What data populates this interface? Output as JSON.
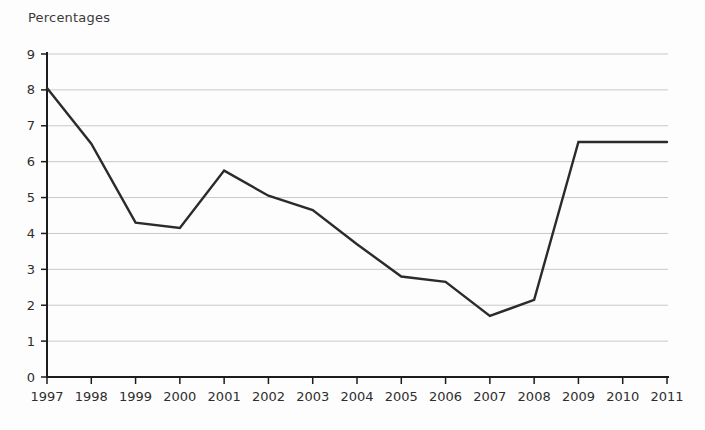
{
  "chart_data": {
    "type": "line",
    "title": "Percentages",
    "xlabel": "",
    "ylabel": "Percentages",
    "x": [
      1997,
      1998,
      1999,
      2000,
      2001,
      2002,
      2003,
      2004,
      2005,
      2006,
      2007,
      2008,
      2009,
      2010,
      2011
    ],
    "values": [
      8.05,
      6.5,
      4.3,
      4.15,
      5.75,
      5.05,
      4.65,
      3.7,
      2.8,
      2.65,
      1.7,
      2.15,
      6.55,
      6.55,
      6.55
    ],
    "ylim": [
      0,
      9
    ],
    "yticks": [
      0,
      1,
      2,
      3,
      4,
      5,
      6,
      7,
      8,
      9
    ],
    "grid": true,
    "legend_position": "none",
    "line_color": "#2b2b2b",
    "axis_color": "#1c1c1c",
    "grid_color": "#c9c9c9",
    "label_color": "#2e2e2e",
    "background_color": "#fdfdfd"
  }
}
